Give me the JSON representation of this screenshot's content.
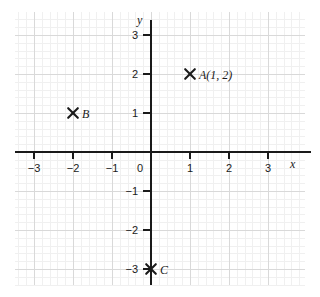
{
  "chart_data": {
    "type": "scatter",
    "title": "",
    "xlabel": "x",
    "ylabel": "y",
    "xlim": [
      -3.5,
      3.7
    ],
    "ylim": [
      -3.5,
      3.4
    ],
    "grid": true,
    "minor_grid": true,
    "legend": "none",
    "xticks": [
      "-3",
      "-2",
      "-1",
      "0",
      "1",
      "2",
      "3"
    ],
    "xtick_values": [
      -3,
      -2,
      -1,
      0,
      1,
      2,
      3
    ],
    "yticks": [
      "3",
      "2",
      "1",
      "0",
      "-1",
      "-2",
      "-3"
    ],
    "ytick_values": [
      3,
      2,
      1,
      0,
      -1,
      -2,
      -3
    ],
    "marker": "x-cross",
    "points": [
      {
        "label": "A(1, 2)",
        "name": "A",
        "x": 1,
        "y": 2
      },
      {
        "label": "B",
        "name": "B",
        "x": -2,
        "y": 1
      },
      {
        "label": "C",
        "name": "C",
        "x": 0,
        "y": -3
      }
    ]
  },
  "axes": {
    "x_name": "x",
    "y_name": "y"
  },
  "colors": {
    "axis": "#1a1a1a",
    "grid_major": "#d9d9d9",
    "grid_minor": "#f0f0f0",
    "background": "#ffffff",
    "marker": "#1a1a1a"
  }
}
